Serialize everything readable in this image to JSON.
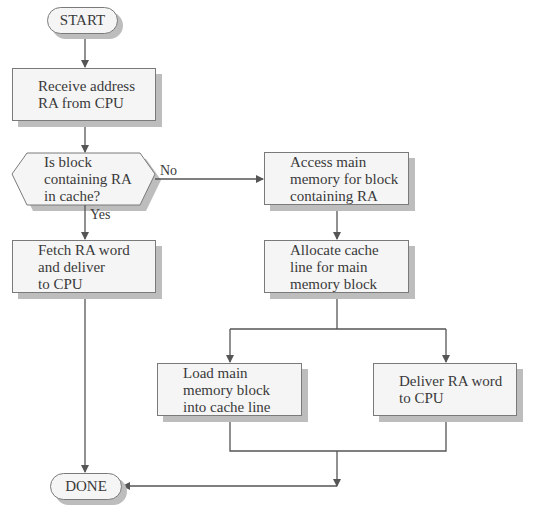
{
  "diagram": {
    "type": "flowchart",
    "nodes": {
      "start": {
        "label": "START",
        "shape": "terminal"
      },
      "receive": {
        "label": "Receive address\nRA from CPU",
        "shape": "process"
      },
      "decision": {
        "label": "Is block\ncontaining RA\nin cache?",
        "shape": "decision"
      },
      "fetch": {
        "label": "Fetch RA word\nand deliver\nto CPU",
        "shape": "process"
      },
      "access": {
        "label": "Access main\nmemory for block\ncontaining RA",
        "shape": "process"
      },
      "allocate": {
        "label": "Allocate cache\nline for main\nmemory block",
        "shape": "process"
      },
      "load": {
        "label": "Load main\nmemory block\ninto cache line",
        "shape": "process"
      },
      "deliver": {
        "label": "Deliver RA word\nto CPU",
        "shape": "process"
      },
      "done": {
        "label": "DONE",
        "shape": "terminal"
      }
    },
    "edges": {
      "yes_label": "Yes",
      "no_label": "No"
    },
    "colors": {
      "fill": "#f5f5f5",
      "stroke": "#7a7a7a",
      "shadow": "#bdbdbd",
      "line": "#555555",
      "text": "#3a3a3a"
    }
  }
}
